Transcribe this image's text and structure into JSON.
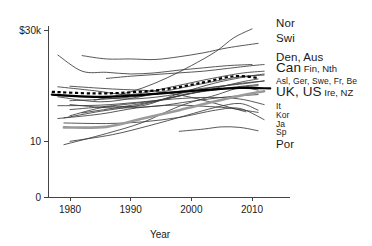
{
  "chart_data": {
    "type": "line",
    "title": "",
    "subtitle": "",
    "xlabel": "Year",
    "ylabel": "",
    "xlim": [
      1976,
      2013
    ],
    "ylim": [
      0,
      31
    ],
    "grid": false,
    "legend_position": "right-outside",
    "y_ticks": [
      {
        "value": 0,
        "label": "0"
      },
      {
        "value": 10,
        "label": "10"
      },
      {
        "value": 30,
        "label": "$30k"
      }
    ],
    "x_ticks": [
      {
        "value": 1980,
        "label": "1980"
      },
      {
        "value": 1990,
        "label": "1990"
      },
      {
        "value": 2000,
        "label": "2000"
      },
      {
        "value": 2010,
        "label": "2010"
      }
    ],
    "units": "US dollars per capita (thousands)",
    "series": [
      {
        "name": "Nor",
        "style": "thin",
        "x": [
          1984,
          1988,
          1992,
          1996,
          2000,
          2004,
          2007,
          2010
        ],
        "values": [
          17.4,
          18.3,
          19.6,
          21.4,
          23.6,
          26.1,
          28.6,
          30.2
        ]
      },
      {
        "name": "Swi",
        "style": "thin",
        "x": [
          1982,
          1986,
          1990,
          1994,
          1998,
          2002,
          2006,
          2011
        ],
        "values": [
          25.4,
          24.8,
          24.8,
          24.7,
          25.2,
          25.9,
          26.8,
          27.6
        ]
      },
      {
        "name": "Den",
        "style": "thin",
        "x": [
          1978,
          1982,
          1986,
          1990,
          1994,
          1998,
          2002,
          2006,
          2010
        ],
        "values": [
          25.5,
          22.6,
          22.4,
          22.1,
          22.3,
          22.8,
          23.2,
          23.6,
          23.8
        ]
      },
      {
        "name": "Aus",
        "style": "thin",
        "x": [
          1986,
          1990,
          1994,
          1998,
          2002,
          2006,
          2010,
          2012
        ],
        "values": [
          21.3,
          21.7,
          22.0,
          22.3,
          22.6,
          23.1,
          23.6,
          23.8
        ]
      },
      {
        "name": "Can",
        "style": "thin",
        "x": [
          1978,
          1984,
          1990,
          1996,
          2002,
          2008,
          2012
        ],
        "values": [
          19.8,
          19.1,
          18.4,
          19.6,
          21.0,
          22.2,
          22.6
        ]
      },
      {
        "name": "Fin",
        "style": "thin",
        "x": [
          1980,
          1986,
          1992,
          1998,
          2004,
          2009,
          2012
        ],
        "values": [
          14.6,
          16.2,
          16.4,
          18.6,
          20.5,
          21.6,
          22.1
        ]
      },
      {
        "name": "Nth",
        "style": "thin",
        "x": [
          1978,
          1985,
          1991,
          1997,
          2003,
          2008,
          2012
        ],
        "values": [
          18.0,
          17.1,
          17.9,
          19.3,
          20.6,
          21.6,
          21.9
        ]
      },
      {
        "name": "Asl",
        "style": "thin",
        "x": [
          1979,
          1985,
          1991,
          1997,
          2003,
          2008,
          2011
        ],
        "values": [
          14.2,
          15.4,
          16.4,
          17.9,
          19.3,
          20.6,
          21.2
        ]
      },
      {
        "name": "Ger",
        "style": "thin",
        "x": [
          1980,
          1986,
          1992,
          1998,
          2004,
          2009,
          2012
        ],
        "values": [
          17.3,
          17.6,
          18.2,
          19.0,
          19.8,
          20.4,
          20.9
        ]
      },
      {
        "name": "Swe",
        "style": "thin",
        "x": [
          1978,
          1984,
          1990,
          1996,
          2002,
          2008,
          2012
        ],
        "values": [
          18.2,
          17.9,
          17.6,
          18.2,
          19.4,
          20.4,
          20.8
        ]
      },
      {
        "name": "Fr",
        "style": "thin",
        "x": [
          1980,
          1987,
          1994,
          2000,
          2006,
          2011
        ],
        "values": [
          15.7,
          16.4,
          17.3,
          18.7,
          19.6,
          20.2
        ]
      },
      {
        "name": "Be",
        "style": "thin",
        "x": [
          1982,
          1988,
          1994,
          2000,
          2006,
          2011
        ],
        "values": [
          15.1,
          16.1,
          17.2,
          18.6,
          19.5,
          20.0
        ]
      },
      {
        "name": "UK",
        "style": "bold-dashed",
        "x": [
          1977,
          1984,
          1990,
          1996,
          2002,
          2007,
          2011
        ],
        "values": [
          18.9,
          18.6,
          18.8,
          19.4,
          20.6,
          21.7,
          21.4
        ]
      },
      {
        "name": "US",
        "style": "bold-black",
        "x": [
          1977,
          1984,
          1990,
          1996,
          2002,
          2008,
          2013
        ],
        "values": [
          18.4,
          18.0,
          18.2,
          18.7,
          19.2,
          19.6,
          19.5
        ]
      },
      {
        "name": "Ire",
        "style": "thin",
        "x": [
          1979,
          1986,
          1992,
          1998,
          2004,
          2008,
          2011
        ],
        "values": [
          9.4,
          11.4,
          13.4,
          16.3,
          18.3,
          19.6,
          19.2
        ]
      },
      {
        "name": "NZ",
        "style": "thin",
        "x": [
          1980,
          1987,
          1994,
          2000,
          2006,
          2011
        ],
        "values": [
          16.6,
          16.0,
          16.3,
          17.2,
          18.0,
          18.4
        ]
      },
      {
        "name": "It",
        "style": "thin",
        "x": [
          1978,
          1985,
          1991,
          1997,
          2003,
          2008,
          2012
        ],
        "values": [
          16.4,
          16.5,
          17.0,
          17.6,
          17.9,
          17.6,
          16.6
        ]
      },
      {
        "name": "Kor",
        "style": "bold-gray",
        "x": [
          1979,
          1986,
          1992,
          1998,
          2004,
          2009,
          2012
        ],
        "values": [
          12.5,
          12.6,
          14.1,
          15.6,
          17.2,
          18.4,
          19.0
        ]
      },
      {
        "name": "Ja",
        "style": "thin",
        "x": [
          1978,
          1985,
          1991,
          1997,
          2002,
          2006,
          2011
        ],
        "values": [
          14.1,
          14.9,
          16.0,
          16.5,
          16.3,
          16.0,
          15.2
        ]
      },
      {
        "name": "Sp",
        "style": "thin",
        "x": [
          1980,
          1987,
          1993,
          1999,
          2004,
          2008,
          2011
        ],
        "values": [
          10.0,
          11.2,
          12.8,
          14.6,
          16.1,
          16.8,
          15.6
        ]
      },
      {
        "name": "Por",
        "style": "thin",
        "x": [
          1998,
          2002,
          2005,
          2008,
          2011
        ],
        "values": [
          11.8,
          12.2,
          12.6,
          12.5,
          11.9
        ]
      },
      {
        "name": "Gre",
        "style": "thin",
        "x": [
          1979,
          1986,
          1992,
          1998,
          2004,
          2008,
          2012
        ],
        "values": [
          13.3,
          13.2,
          13.5,
          14.3,
          15.6,
          15.9,
          13.9
        ]
      },
      {
        "name": "Lux",
        "style": "thin",
        "x": [
          1980,
          1987,
          1994,
          2000,
          2005,
          2009
        ],
        "values": [
          19.9,
          19.4,
          19.0,
          17.9,
          16.5,
          15.3
        ]
      }
    ]
  },
  "legend": {
    "rows": [
      {
        "lead": "Nor",
        "rest": "",
        "size": "normal",
        "y": 14
      },
      {
        "lead": "Swi",
        "rest": "",
        "size": "normal",
        "y": 29
      },
      {
        "lead": "Den, Aus",
        "rest": "",
        "size": "normal",
        "y": 48
      },
      {
        "lead": "Can",
        "rest": "Fin, Nth",
        "size": "big",
        "y": 59
      },
      {
        "lead": "Asl, Ger, Swe, Fr, Be",
        "rest": "",
        "size": "small",
        "y": 71
      },
      {
        "lead": "UK, US",
        "rest": "Ire, NZ",
        "size": "big",
        "y": 83
      },
      {
        "lead": "It",
        "rest": "",
        "size": "small",
        "y": 96
      },
      {
        "lead": "Kor",
        "rest": "",
        "size": "small",
        "y": 105
      },
      {
        "lead": "Ja",
        "rest": "",
        "size": "small",
        "y": 114
      },
      {
        "lead": "Sp",
        "rest": "",
        "size": "small",
        "y": 122
      },
      {
        "lead": "Por",
        "rest": "",
        "size": "normal",
        "y": 135
      }
    ]
  },
  "colors": {
    "axis": "#444444",
    "thin_line": "#3a3a3a",
    "bold_black": "#000000",
    "bold_gray": "#9a9a9a",
    "text": "#1a1a1a",
    "background": "#ffffff"
  }
}
